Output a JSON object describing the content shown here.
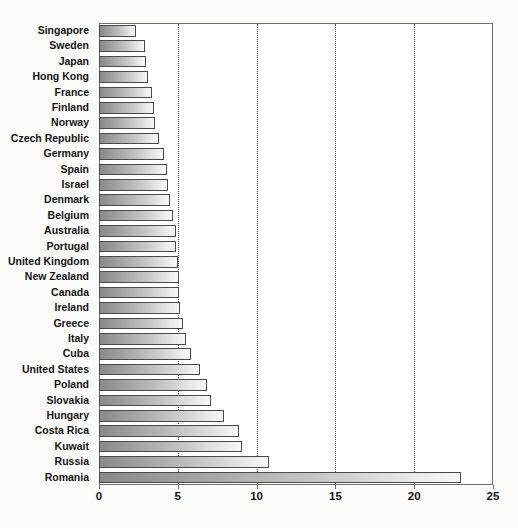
{
  "chart_data": {
    "type": "bar",
    "orientation": "horizontal",
    "title": "",
    "subtitle": "",
    "xlabel": "",
    "ylabel": "",
    "xlim": [
      0,
      25
    ],
    "grid": true,
    "legend": false,
    "xticks": [
      0,
      5,
      10,
      15,
      20,
      25
    ],
    "xticklabels": [
      "0",
      "5",
      "10",
      "15",
      "20",
      "25"
    ],
    "categories": [
      "Singapore",
      "Sweden",
      "Japan",
      "Hong Kong",
      "France",
      "Finland",
      "Norway",
      "Czech Republic",
      "Germany",
      "Spain",
      "Israel",
      "Denmark",
      "Belgium",
      "Australia",
      "Portugal",
      "United Kingdom",
      "New Zealand",
      "Canada",
      "Ireland",
      "Greece",
      "Italy",
      "Cuba",
      "United States",
      "Poland",
      "Slovakia",
      "Hungary",
      "Costa Rica",
      "Kuwait",
      "Russia",
      "Romania"
    ],
    "values": [
      2.35,
      2.9,
      3.0,
      3.1,
      3.35,
      3.5,
      3.55,
      3.8,
      4.1,
      4.3,
      4.4,
      4.5,
      4.7,
      4.9,
      4.9,
      5.0,
      5.05,
      5.1,
      5.15,
      5.3,
      5.55,
      5.85,
      6.4,
      6.85,
      7.1,
      7.9,
      8.9,
      9.1,
      10.8,
      23.0
    ]
  },
  "colors": {
    "bar_dark": "#8a8a8a",
    "bar_light": "#f7f7f7",
    "bar_border": "#4a4a4a",
    "axis": "#6f6f6f",
    "grid": "#4d4d4d",
    "text": "#141414",
    "plot_bg": "#ffffff",
    "page_bg": "#fbfbfa"
  }
}
